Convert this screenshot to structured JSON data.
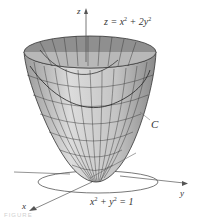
{
  "figure": {
    "surface_equation": {
      "lhs": "z = x",
      "exp1": "2",
      "mid": " + 2y",
      "exp2": "2"
    },
    "curve_label": "C",
    "circle_equation": {
      "a": "x",
      "exp1": "2",
      "b": " + y",
      "exp2": "2",
      "rhs": " = 1"
    },
    "axes": {
      "x": "x",
      "y": "y",
      "z": "z"
    },
    "caption": "FIGURE",
    "colors": {
      "surface_outer": "#c8c8c8",
      "surface_inner": "#8f8f8f",
      "mesh": "#333333",
      "axis": "#555555",
      "text": "#333333"
    }
  }
}
